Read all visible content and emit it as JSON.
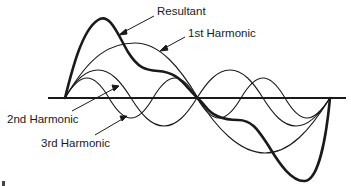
{
  "diagram": {
    "type": "waveform-harmonics",
    "labels": {
      "resultant": "Resultant",
      "first": "1st Harmonic",
      "second": "2nd Harmonic",
      "third": "3rd Harmonic"
    },
    "colors": {
      "background": "#ffffff",
      "stroke": "#1a1a1a",
      "text": "#1a1a1a"
    },
    "elements": [
      {
        "name": "baseline",
        "kind": "horizontal-axis"
      },
      {
        "name": "resultant-wave",
        "kind": "curve",
        "weight": "thick"
      },
      {
        "name": "first-harmonic-wave",
        "kind": "curve",
        "cycles": 1
      },
      {
        "name": "second-harmonic-wave",
        "kind": "curve",
        "cycles": 2
      },
      {
        "name": "third-harmonic-wave",
        "kind": "curve",
        "cycles": 3
      }
    ]
  }
}
